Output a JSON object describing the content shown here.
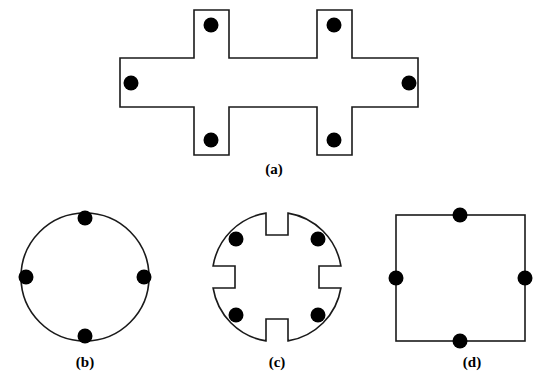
{
  "figure": {
    "background_color": "#ffffff",
    "outline_color": "#1a1a1a",
    "marker_color": "#000000",
    "fill_color": "#ffffff",
    "outline_width": 1.6,
    "marker_radius": 7.5,
    "panels": [
      {
        "id": "a",
        "label": "(a)",
        "shape": "double-cross-polygon",
        "marker_count": 6,
        "outline_points": [
          [
            120,
            58
          ],
          [
            194,
            58
          ],
          [
            194,
            10
          ],
          [
            229,
            10
          ],
          [
            229,
            58
          ],
          [
            317,
            58
          ],
          [
            317,
            10
          ],
          [
            352,
            10
          ],
          [
            352,
            58
          ],
          [
            418,
            58
          ],
          [
            418,
            107
          ],
          [
            352,
            107
          ],
          [
            352,
            155
          ],
          [
            317,
            155
          ],
          [
            317,
            107
          ],
          [
            229,
            107
          ],
          [
            229,
            155
          ],
          [
            194,
            155
          ],
          [
            194,
            107
          ],
          [
            120,
            107
          ]
        ],
        "markers": [
          [
            211,
            25
          ],
          [
            334,
            25
          ],
          [
            131,
            83
          ],
          [
            409,
            83
          ],
          [
            211,
            140
          ],
          [
            334,
            140
          ]
        ]
      },
      {
        "id": "b",
        "label": "(b)",
        "shape": "circle",
        "marker_count": 4,
        "center": [
          85,
          277
        ],
        "radius": 64,
        "markers": [
          [
            85,
            218
          ],
          [
            26,
            277
          ],
          [
            144,
            277
          ],
          [
            85,
            336
          ]
        ]
      },
      {
        "id": "c",
        "label": "(c)",
        "shape": "slotted-circle",
        "marker_count": 4,
        "center": [
          277,
          277
        ],
        "radius": 64,
        "slot_half_width": 11,
        "slot_depth": 42,
        "markers": [
          [
            236,
            239
          ],
          [
            318,
            239
          ],
          [
            236,
            315
          ],
          [
            318,
            315
          ]
        ]
      },
      {
        "id": "d",
        "label": "(d)",
        "shape": "square",
        "marker_count": 4,
        "rect": [
          396,
          215,
          129,
          126
        ],
        "markers": [
          [
            460,
            215
          ],
          [
            396,
            278
          ],
          [
            525,
            278
          ],
          [
            460,
            341
          ]
        ]
      }
    ]
  }
}
